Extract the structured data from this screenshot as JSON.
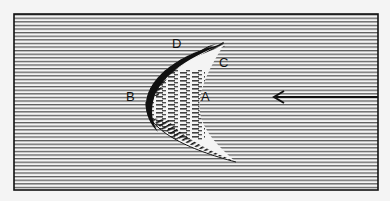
{
  "diagram": {
    "labels": {
      "A": "A",
      "B": "B",
      "C": "C",
      "D": "D"
    },
    "flow_arrow": {
      "direction": "left"
    },
    "colors": {
      "background": "#f4f4f4",
      "lines": "#555555",
      "ink": "#111111",
      "crescent_fill": "#f4f4f4"
    }
  }
}
